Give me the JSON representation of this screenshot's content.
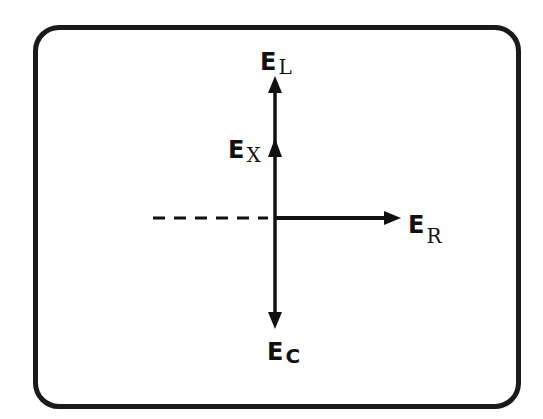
{
  "diagram": {
    "type": "phasor-diagram",
    "colors": {
      "stroke": "#111111",
      "frame": "#1a1a1a",
      "background": "#ffffff"
    },
    "vectors": [
      {
        "id": "EL",
        "main": "E",
        "sub": "L",
        "direction": "up"
      },
      {
        "id": "EX",
        "main": "E",
        "sub": "X",
        "direction": "up"
      },
      {
        "id": "ER",
        "main": "E",
        "sub": "R",
        "direction": "right"
      },
      {
        "id": "EC",
        "main": "E",
        "sub": "C",
        "direction": "down"
      }
    ],
    "reference_line": {
      "style": "dashed",
      "direction": "left"
    }
  }
}
